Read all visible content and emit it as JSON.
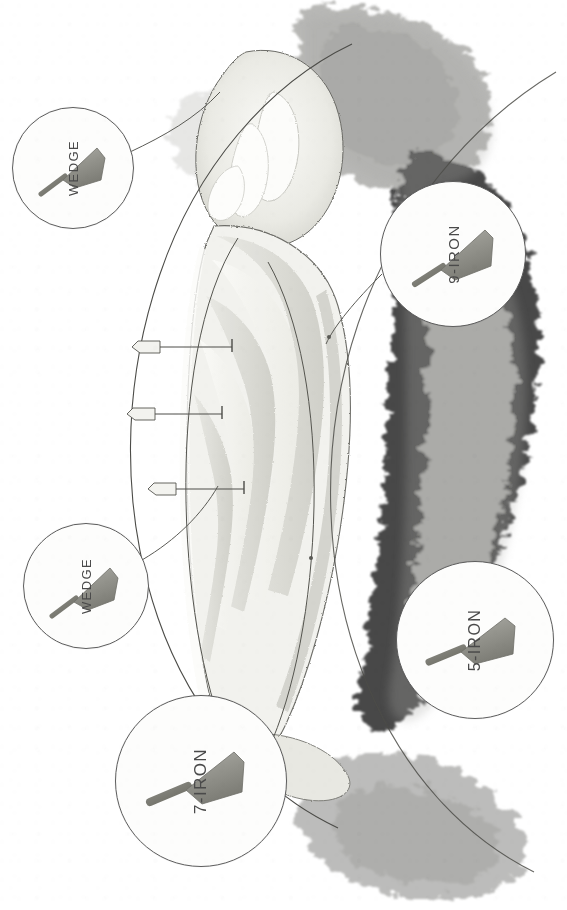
{
  "illustration": {
    "title": "Golf hole strategy yardage diagram",
    "medium": "pencil drawing",
    "orientation": "rotated-90",
    "background_color": "#ffffff",
    "ink_color": "#4a4a4a",
    "turf_color": "#d8d8d2",
    "rough_color": "#9a9a98",
    "sand_color": "#fbfbf8"
  },
  "callouts": [
    {
      "id": "wedge-top",
      "label": "WEDGE",
      "club": "wedge",
      "cx": 72,
      "cy": 167,
      "r": 60,
      "font_size": 13
    },
    {
      "id": "nine-iron",
      "label": "9-IRON",
      "club": "iron",
      "cx": 452,
      "cy": 253,
      "r": 72,
      "font_size": 15
    },
    {
      "id": "wedge-middle",
      "label": "WEDGE",
      "club": "wedge",
      "cx": 85,
      "cy": 585,
      "r": 62,
      "font_size": 13
    },
    {
      "id": "five-iron",
      "label": "5-IRON",
      "club": "iron",
      "cx": 474,
      "cy": 639,
      "r": 78,
      "font_size": 16
    },
    {
      "id": "seven-iron",
      "label": "7-IRON",
      "club": "iron",
      "cx": 200,
      "cy": 780,
      "r": 85,
      "font_size": 17
    }
  ],
  "markers": [
    {
      "id": "flag-marker-1",
      "type": "flag",
      "x": 160,
      "y": 346
    },
    {
      "id": "flag-marker-2",
      "type": "flag",
      "x": 155,
      "y": 413
    },
    {
      "id": "flag-marker-3",
      "type": "flag",
      "x": 175,
      "y": 488
    }
  ],
  "features": {
    "green": "putting green at top with flanking bunkers",
    "fairway": "mown striped fairway fanning down the centre",
    "rough": "dark stippled trees and rough along the right and top edges",
    "arcs": "two long sweeping distance arcs crossing the hole"
  },
  "caption": {
    "text": ""
  }
}
